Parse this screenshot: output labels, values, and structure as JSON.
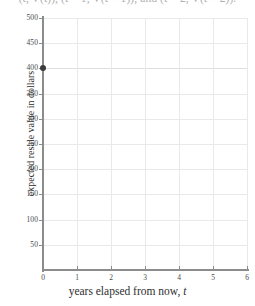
{
  "formula": {
    "text": "(t, V(t)), (t + 1, V(t + 1)), and (t + 2, V(t + 2))."
  },
  "chart_data": {
    "type": "scatter",
    "title": "",
    "xlabel": "years elapsed from now, t",
    "xlabel_prefix": "years elapsed from now, ",
    "xlabel_var": "t",
    "ylabel": "expected resale value in dollars",
    "xlim": [
      0,
      6
    ],
    "ylim": [
      0,
      500
    ],
    "xticks": [
      0,
      1,
      2,
      3,
      4,
      5,
      6
    ],
    "xtick_labels": [
      "0",
      "1",
      "2",
      "3",
      "4",
      "5",
      "6"
    ],
    "yticks": [
      50,
      100,
      150,
      200,
      250,
      300,
      350,
      400,
      450,
      500
    ],
    "ytick_labels": [
      "50",
      "100",
      "150",
      "200",
      "250",
      "300",
      "350",
      "400",
      "450",
      "500"
    ],
    "grid": true,
    "grid_x_step": 1,
    "grid_y_step": 50,
    "legend": null,
    "points": [
      {
        "x": 0,
        "y": 400,
        "label": "(0, 400)"
      }
    ],
    "series": [
      {
        "name": "expected resale value",
        "x": [
          0
        ],
        "values": [
          400
        ]
      }
    ],
    "colors": {
      "point": "#3b3b3b",
      "axis": "#8c8c8c",
      "grid": "#e9e9e9",
      "text": "#2e2e2e",
      "background": "#ffffff"
    }
  }
}
